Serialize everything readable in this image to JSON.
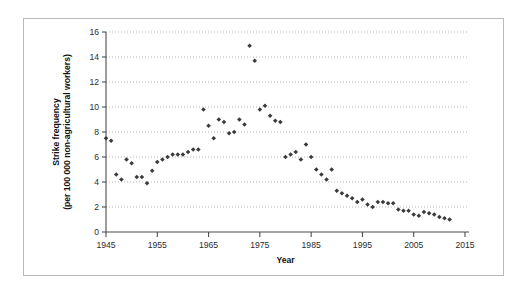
{
  "figure": {
    "frame_border_color": "#b9b9b9",
    "background_color": "#ffffff"
  },
  "chart_data": {
    "type": "scatter",
    "title": "",
    "subtitle": "",
    "xlabel": "Year",
    "ylabel": "Strike frequency (per 100 000 non-agricultural workers)",
    "ylabel_line1": "Strike frequency",
    "ylabel_line2": "(per 100 000 non-agricultural workers)",
    "xlim": [
      1945,
      2015
    ],
    "ylim": [
      0,
      16
    ],
    "xticks": [
      1945,
      1955,
      1965,
      1975,
      1985,
      1995,
      2005,
      2015
    ],
    "xtick_labels": [
      "1945",
      "1955",
      "1965",
      "1975",
      "1985",
      "1995",
      "2005",
      "2015"
    ],
    "yticks": [
      0,
      2,
      4,
      6,
      8,
      10,
      12,
      14,
      16
    ],
    "ytick_labels": [
      "0",
      "2",
      "4",
      "6",
      "8",
      "10",
      "12",
      "14",
      "16"
    ],
    "grid": "horizontal-dotted",
    "legend": "none",
    "marker": "diamond",
    "marker_color": "#3b3b3b",
    "series": [
      {
        "name": "Strike frequency",
        "x": [
          1945,
          1946,
          1947,
          1948,
          1949,
          1950,
          1951,
          1952,
          1953,
          1954,
          1955,
          1956,
          1957,
          1958,
          1959,
          1960,
          1961,
          1962,
          1963,
          1964,
          1965,
          1966,
          1967,
          1968,
          1969,
          1970,
          1971,
          1972,
          1973,
          1974,
          1975,
          1976,
          1977,
          1978,
          1979,
          1980,
          1981,
          1982,
          1983,
          1984,
          1985,
          1986,
          1987,
          1988,
          1989,
          1990,
          1991,
          1992,
          1993,
          1994,
          1995,
          1996,
          1997,
          1998,
          1999,
          2000,
          2001,
          2002,
          2003,
          2004,
          2005,
          2006,
          2007,
          2008,
          2009,
          2010,
          2011,
          2012
        ],
        "y": [
          7.5,
          7.3,
          4.6,
          4.2,
          5.8,
          5.5,
          4.4,
          4.4,
          3.9,
          4.9,
          5.6,
          5.8,
          6.0,
          6.2,
          6.2,
          6.2,
          6.4,
          6.6,
          6.6,
          9.8,
          8.5,
          7.5,
          9.0,
          8.8,
          7.9,
          8.0,
          9.0,
          8.6,
          14.9,
          13.7,
          9.8,
          10.1,
          9.3,
          8.9,
          8.8,
          6.0,
          6.2,
          6.4,
          5.8,
          7.0,
          6.0,
          5.0,
          4.6,
          4.2,
          5.0,
          3.3,
          3.1,
          2.9,
          2.7,
          2.4,
          2.6,
          2.2,
          2.0,
          2.4,
          2.4,
          2.3,
          2.3,
          1.8,
          1.7,
          1.7,
          1.4,
          1.3,
          1.6,
          1.5,
          1.4,
          1.2,
          1.1,
          1.0
        ]
      }
    ]
  },
  "axes": {
    "x_axis_name": "Year",
    "y_axis_name": "Strike frequency (per 100 000 non-agricultural workers)"
  }
}
